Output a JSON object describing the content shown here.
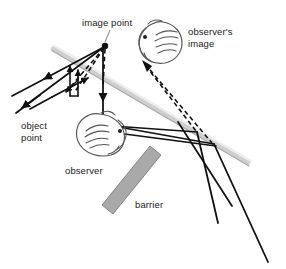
{
  "figure": {
    "title_visible": false,
    "background_color": "#ffffff",
    "labels": {
      "image_point": "image point",
      "observers_image_line1": "observer's",
      "observers_image_line2": "image",
      "object_point_line1": "object",
      "object_point_line2": "point",
      "observer": "observer",
      "barrier": "barrier"
    },
    "colors": {
      "ray_stroke": "#111111",
      "mirror_fill": "#d8d8d8",
      "mirror_edge": "#9a9a9a",
      "barrier_fill": "#a8a8a8",
      "barrier_edge": "#6f6f6f",
      "head_stroke": "#4a4a4a",
      "leader_stroke": "#8c8c8c",
      "text_color": "#1a1a1a"
    },
    "elements": {
      "mirror": {
        "name": "mirror-surface",
        "start_x": 52,
        "start_y": 48,
        "end_x": 250,
        "end_y": 164,
        "thickness": 5
      },
      "image_point_dot": {
        "name": "image-point-dot",
        "x": 105,
        "y": 46,
        "radius": 3.1
      },
      "object_point_marker": {
        "name": "object-point-marker",
        "x": 103,
        "y": 120
      },
      "observer_head": {
        "name": "observer-head",
        "cx": 98,
        "cy": 136,
        "rx": 22,
        "ry": 19
      },
      "observers_image_head": {
        "name": "observers-image-head",
        "cx": 160,
        "cy": 42,
        "rx": 22,
        "ry": 20
      },
      "barrier": {
        "name": "barrier-shape",
        "points": "151,147 160,155 112,213 102,205"
      }
    },
    "ray_counts": {
      "diverging_rays_left": 3,
      "rays_to_mirror_right": 3,
      "dashed_virtual_rays": 3
    }
  }
}
